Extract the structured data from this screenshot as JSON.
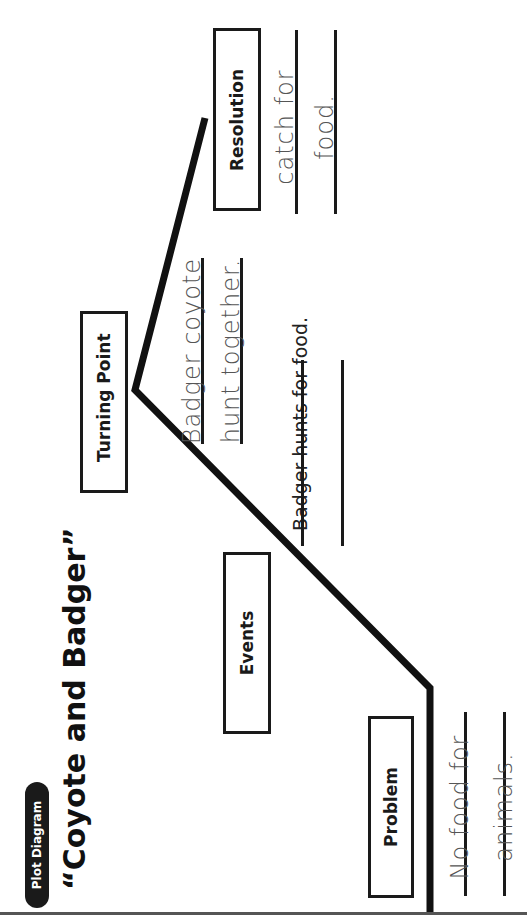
{
  "header": {
    "badge": "Plot Diagram",
    "title": "“Coyote and Badger”"
  },
  "stages": {
    "problem": {
      "label": "Problem",
      "answer_lines": [
        "No food for",
        "animals."
      ]
    },
    "events": {
      "label": "Events",
      "prompt": "Badger hunts for food."
    },
    "turning_point": {
      "label": "Turning Point",
      "answer_lines": [
        "Badger coyote",
        "hunt together."
      ]
    },
    "resolution": {
      "label": "Resolution",
      "answer_lines": [
        "catch for",
        "food."
      ]
    }
  },
  "colors": {
    "ink": "#1a1a1a",
    "pencil": "#555555",
    "background": "#ffffff"
  }
}
